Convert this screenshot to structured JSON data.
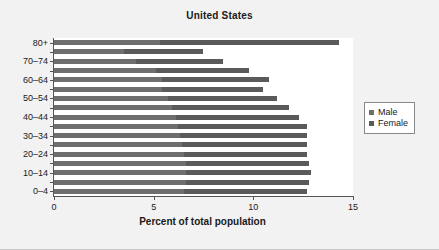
{
  "chart_data": {
    "type": "bar",
    "title": "United States",
    "xlabel": "Percent of total population",
    "ylabel": "",
    "orientation": "horizontal",
    "stacked": true,
    "grid": false,
    "xlim": [
      0,
      15
    ],
    "xticks": [
      0,
      5,
      10,
      15
    ],
    "xtick_labels": [
      "0",
      "5",
      "10",
      "15"
    ],
    "categories": [
      "0–4",
      "5–9",
      "10–14",
      "15–19",
      "20–24",
      "25–29",
      "30–34",
      "35–39",
      "40–44",
      "45–49",
      "50–54",
      "55–59",
      "60–64",
      "65–69",
      "70–74",
      "75–79",
      "80+"
    ],
    "ytick_labels": [
      "0–4",
      "",
      "10–14",
      "",
      "20–24",
      "",
      "30–34",
      "",
      "40–44",
      "",
      "50–54",
      "",
      "60–64",
      "",
      "70–74",
      "",
      "80+"
    ],
    "legend": {
      "position": "right",
      "entries": [
        {
          "name": "Male",
          "color": "#6e6e6e"
        },
        {
          "name": "Female",
          "color": "#5a5a5a"
        }
      ]
    },
    "series": [
      {
        "name": "Male",
        "color": "#6e6e6e",
        "values": [
          6.5,
          6.6,
          6.6,
          6.6,
          6.5,
          6.4,
          6.3,
          6.2,
          6.1,
          5.9,
          5.7,
          5.4,
          5.4,
          5.1,
          4.1,
          3.5,
          5.3
        ]
      },
      {
        "name": "Female",
        "color": "#5a5a5a",
        "values": [
          6.2,
          6.2,
          6.3,
          6.2,
          6.2,
          6.3,
          6.4,
          6.5,
          6.2,
          5.9,
          5.5,
          5.1,
          5.4,
          4.7,
          4.4,
          4.0,
          9.0
        ]
      }
    ],
    "totals": [
      12.7,
      12.8,
      12.9,
      12.8,
      12.7,
      12.7,
      12.7,
      12.7,
      12.3,
      11.8,
      11.2,
      10.5,
      10.8,
      9.8,
      8.5,
      7.5,
      14.3
    ]
  }
}
